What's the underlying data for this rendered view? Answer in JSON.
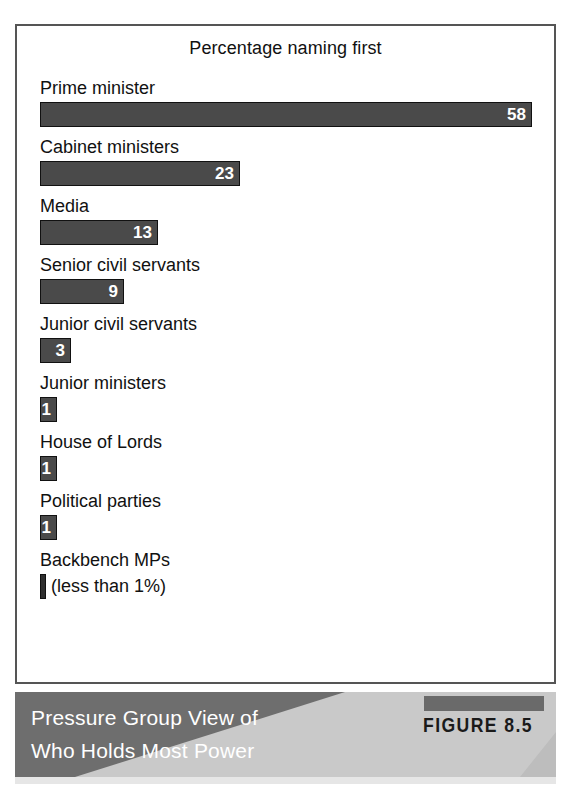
{
  "chart_data": {
    "type": "bar",
    "orientation": "horizontal",
    "title": "Percentage naming first",
    "xlabel": "",
    "ylabel": "",
    "xlim": [
      0,
      58
    ],
    "grid": false,
    "legend": null,
    "categories": [
      "Prime minister",
      "Cabinet ministers",
      "Media",
      "Senior civil servants",
      "Junior civil servants",
      "Junior ministers",
      "House of Lords",
      "Political parties",
      "Backbench MPs"
    ],
    "values": [
      58,
      23,
      13,
      9,
      3,
      1,
      1,
      1,
      0.5
    ],
    "value_labels": [
      "58",
      "23",
      "13",
      "9",
      "3",
      "1",
      "1",
      "1",
      ""
    ],
    "annotations": [
      "(less than 1%)"
    ],
    "bar_color": "#4a4a4a",
    "bar_border_color": "#111111",
    "value_label_color": "#ffffff"
  },
  "chart": {
    "title": "Percentage naming first",
    "bars": [
      {
        "label": "Prime minister",
        "value": "58",
        "width_px": 492,
        "note": ""
      },
      {
        "label": "Cabinet ministers",
        "value": "23",
        "width_px": 200,
        "note": ""
      },
      {
        "label": "Media",
        "value": "13",
        "width_px": 118,
        "note": ""
      },
      {
        "label": "Senior civil servants",
        "value": "9",
        "width_px": 84,
        "note": ""
      },
      {
        "label": "Junior civil servants",
        "value": "3",
        "width_px": 31,
        "note": ""
      },
      {
        "label": "Junior ministers",
        "value": "1",
        "width_px": 17,
        "note": ""
      },
      {
        "label": "House of Lords",
        "value": "1",
        "width_px": 17,
        "note": ""
      },
      {
        "label": "Political parties",
        "value": "1",
        "width_px": 17,
        "note": ""
      },
      {
        "label": "Backbench MPs",
        "value": "",
        "width_px": 6,
        "note": "(less than 1%)"
      }
    ]
  },
  "caption": {
    "line1": "Pressure Group View of",
    "line2": "Who Holds Most Power",
    "figure_tag": "FIGURE 8.5"
  },
  "colors": {
    "bar_fill": "#4a4a4a",
    "bar_stroke": "#111111",
    "panel_border": "#555555",
    "caption_band": "#6e6e6e",
    "caption_wedge": "#c9c9c9",
    "figure_tag_bar": "#6a6a6a",
    "caption_text": "#ffffff",
    "figure_tag_text": "#1a1a1a"
  }
}
